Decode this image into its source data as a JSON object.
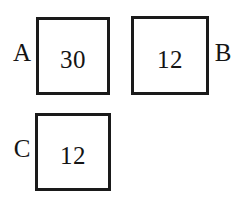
{
  "diagram": {
    "background_color": "#ffffff",
    "border_color": "#1a1a1a",
    "text_color": "#141414",
    "boxes": [
      {
        "id": "A",
        "label": "A",
        "label_side": "left",
        "value": "30"
      },
      {
        "id": "B",
        "label": "B",
        "label_side": "right",
        "value": "12"
      },
      {
        "id": "C",
        "label": "C",
        "label_side": "left",
        "value": "12"
      }
    ]
  }
}
